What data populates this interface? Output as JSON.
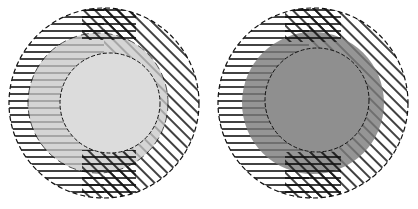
{
  "figure": {
    "panels": [
      {
        "id": "left",
        "center": [
          104,
          103
        ],
        "outer_radius": 95,
        "middle_radius": 70,
        "inner_radius": 50,
        "inner_fill": "#dcdcdc",
        "middle_fill": "#c8c8c8",
        "hatch_color": "#111111",
        "background": "#ffffff"
      },
      {
        "id": "right",
        "center": [
          314,
          103
        ],
        "outer_radius": 95,
        "middle_radius": 70,
        "inner_radius": 50,
        "inner_fill": "#8f8f8f",
        "middle_fill": "#7a7a7a",
        "hatch_color": "#111111",
        "background": "#ffffff"
      }
    ],
    "hatch_patterns": [
      "horizontal-lines",
      "diagonal-lines",
      "cross-hatch"
    ]
  }
}
